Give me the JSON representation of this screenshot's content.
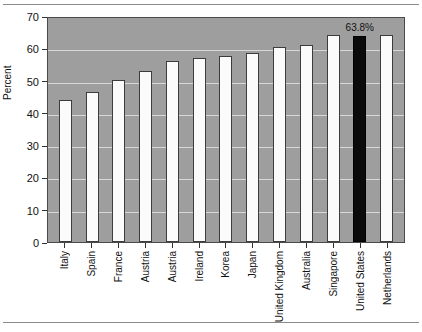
{
  "chart_data": {
    "type": "bar",
    "title": "",
    "xlabel": "",
    "ylabel": "Percent",
    "ylim": [
      0,
      70
    ],
    "yticks": [
      0,
      10,
      20,
      30,
      40,
      50,
      60,
      70
    ],
    "grid": true,
    "legend": null,
    "categories": [
      "Italy",
      "Spain",
      "France",
      "Austria",
      "Austria",
      "Ireland",
      "Korea",
      "Japan",
      "United Kingdom",
      "Australia",
      "Singapore",
      "United States",
      "Netherlands"
    ],
    "values": [
      44.0,
      46.5,
      50.3,
      53.0,
      56.0,
      57.0,
      57.5,
      58.5,
      60.5,
      61.0,
      64.0,
      63.8,
      64.0
    ],
    "annotations": [
      {
        "category": "United States",
        "text": "63.8%"
      }
    ],
    "highlight_category": "United States",
    "colors": {
      "plot_background": "#9e9e9e",
      "bar_fill": "#fbfbfb",
      "bar_edge": "#3c3c3c",
      "highlight_fill": "#0a0a0a",
      "gridline": "#d9d9d9",
      "text": "#111111",
      "page_background": "#ffffff"
    }
  }
}
